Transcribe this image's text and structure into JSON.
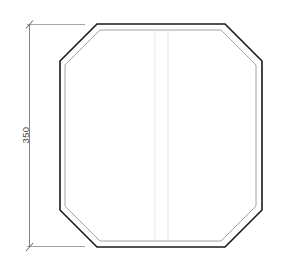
{
  "drawing": {
    "type": "technical-cad-elevation",
    "title": "Octagonal Panel Outline",
    "canvas": {
      "width": 290,
      "height": 267,
      "background": "#ffffff"
    },
    "colors": {
      "outline_outer": "#1a1a1a",
      "outline_inner": "#9a9a9a",
      "dimension_line": "#6b6b6b",
      "extension_line": "#8a8a8a",
      "centerline": "#efefef",
      "text": "#4a4a4a"
    },
    "shape": {
      "name": "octagon",
      "description": "Square with 45 degree chamfered corners, drawn as double outline",
      "outer": {
        "left": 60,
        "right": 262,
        "top": 24,
        "bottom": 247,
        "chamfer": 37,
        "points": "97,24 225,24 262,61 262,210 225,247 97,247 60,210 60,61"
      },
      "inner": {
        "offset": 5,
        "points": "100,30 221,30 256,65 256,206 221,241 100,241 65,206 65,65"
      }
    },
    "centerlines": [
      {
        "name": "centerline-left",
        "x": 155,
        "y1": 30,
        "y2": 241
      },
      {
        "name": "centerline-right",
        "x": 168,
        "y1": 30,
        "y2": 241
      }
    ],
    "dimensions": [
      {
        "id": "height",
        "value": "350",
        "orientation": "vertical",
        "line_x": 29,
        "y_start": 24,
        "y_end": 247,
        "extension_end_x": 85,
        "tick_style": "slash"
      }
    ]
  }
}
